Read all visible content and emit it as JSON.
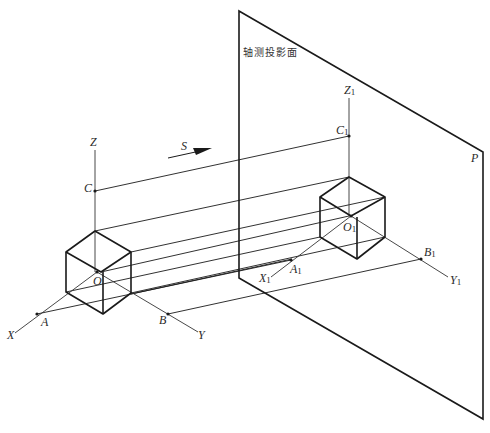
{
  "diagram": {
    "title_cn": "轴测投影面",
    "plane_label": "P",
    "direction_label": "S",
    "original_axes": {
      "origin": "O",
      "x_axis": "X",
      "y_axis": "Y",
      "z_axis": "Z",
      "points": {
        "a": "A",
        "b": "B",
        "c": "C"
      }
    },
    "projected_axes": {
      "origin": "O",
      "origin_sub": "1",
      "x_axis": "X",
      "x_sub": "1",
      "y_axis": "Y",
      "y_sub": "1",
      "z_axis": "Z",
      "z_sub": "1",
      "points": {
        "a": "A",
        "a_sub": "1",
        "b": "B",
        "b_sub": "1",
        "c": "C",
        "c_sub": "1"
      }
    },
    "colors": {
      "line": "#1a1a1a",
      "thin_line": "#333333",
      "background": "#ffffff"
    }
  }
}
